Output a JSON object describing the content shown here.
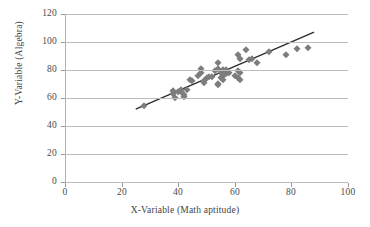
{
  "chart_data": {
    "type": "scatter",
    "title": "",
    "xlabel": "X-Variable (Math aptitude)",
    "ylabel": "Y-Variable (Algebra)",
    "xlim": [
      0,
      100
    ],
    "ylim": [
      0,
      120
    ],
    "xticks": [
      0,
      20,
      40,
      60,
      80,
      100
    ],
    "yticks": [
      0,
      20,
      40,
      60,
      80,
      100,
      120
    ],
    "grid": "horizontal",
    "legend": "none",
    "marker_color": "#7d7d7d",
    "marker_shape": "diamond",
    "trendline_color": "#2b2b2b",
    "points": [
      {
        "x": 28,
        "y": 54
      },
      {
        "x": 38,
        "y": 65
      },
      {
        "x": 38,
        "y": 63
      },
      {
        "x": 39,
        "y": 60
      },
      {
        "x": 40,
        "y": 64
      },
      {
        "x": 41,
        "y": 64
      },
      {
        "x": 41,
        "y": 66
      },
      {
        "x": 42,
        "y": 62
      },
      {
        "x": 42,
        "y": 61
      },
      {
        "x": 43,
        "y": 66
      },
      {
        "x": 44,
        "y": 73
      },
      {
        "x": 45,
        "y": 72
      },
      {
        "x": 47,
        "y": 76
      },
      {
        "x": 48,
        "y": 81
      },
      {
        "x": 48,
        "y": 78
      },
      {
        "x": 49,
        "y": 72
      },
      {
        "x": 49,
        "y": 71
      },
      {
        "x": 50,
        "y": 74
      },
      {
        "x": 51,
        "y": 75
      },
      {
        "x": 52,
        "y": 75
      },
      {
        "x": 53,
        "y": 79
      },
      {
        "x": 54,
        "y": 85
      },
      {
        "x": 54,
        "y": 81
      },
      {
        "x": 54,
        "y": 70
      },
      {
        "x": 54,
        "y": 69
      },
      {
        "x": 55,
        "y": 78
      },
      {
        "x": 55,
        "y": 74
      },
      {
        "x": 56,
        "y": 80
      },
      {
        "x": 56,
        "y": 79
      },
      {
        "x": 56,
        "y": 76
      },
      {
        "x": 56,
        "y": 73
      },
      {
        "x": 57,
        "y": 80
      },
      {
        "x": 57,
        "y": 77
      },
      {
        "x": 58,
        "y": 78
      },
      {
        "x": 60,
        "y": 76
      },
      {
        "x": 61,
        "y": 91
      },
      {
        "x": 61,
        "y": 79
      },
      {
        "x": 61,
        "y": 74
      },
      {
        "x": 62,
        "y": 88
      },
      {
        "x": 62,
        "y": 78
      },
      {
        "x": 62,
        "y": 73
      },
      {
        "x": 64,
        "y": 94
      },
      {
        "x": 65,
        "y": 87
      },
      {
        "x": 66,
        "y": 88
      },
      {
        "x": 68,
        "y": 85
      },
      {
        "x": 72,
        "y": 93
      },
      {
        "x": 78,
        "y": 91
      },
      {
        "x": 82,
        "y": 95
      },
      {
        "x": 86,
        "y": 96
      }
    ],
    "trendline": {
      "x0": 25,
      "y0": 52,
      "x1": 88,
      "y1": 107
    }
  }
}
